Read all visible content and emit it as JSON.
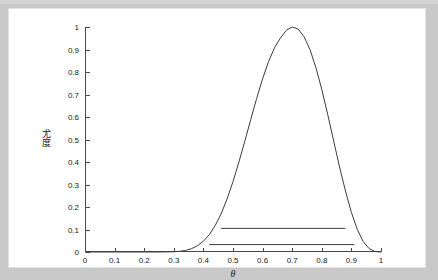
{
  "figure": {
    "background_color": "#c9c9c9",
    "card_color": "#ffffff",
    "axis_color": "#4a4a4a",
    "curve_color": "#3c3c3c"
  },
  "axis_titles": {
    "x": "θ",
    "y_char_1": "尤",
    "y_char_2": "度",
    "y_full": "尤度"
  },
  "chart_data": {
    "type": "line",
    "title": "",
    "xlabel": "θ",
    "ylabel": "尤度",
    "xlim": [
      0,
      1
    ],
    "ylim": [
      0,
      1
    ],
    "grid": false,
    "legend": "none",
    "xticks": [
      "0",
      "0.1",
      "0.2",
      "0.3",
      "0.4",
      "0.5",
      "0.6",
      "0.7",
      "0.8",
      "0.9",
      "1"
    ],
    "xtick_values": [
      0,
      0.1,
      0.2,
      0.3,
      0.4,
      0.5,
      0.6,
      0.7,
      0.8,
      0.9,
      1
    ],
    "yticks": [
      "0",
      "0.1",
      "0.2",
      "0.3",
      "0.4",
      "0.5",
      "0.6",
      "0.7",
      "0.8",
      "0.9",
      "1"
    ],
    "ytick_values": [
      0,
      0.1,
      0.2,
      0.3,
      0.4,
      0.5,
      0.6,
      0.7,
      0.8,
      0.9,
      1
    ],
    "series": [
      {
        "name": "likelihood",
        "type": "line",
        "peak_x": 0.7,
        "peak_y": 1.0,
        "x": [
          0.0,
          0.05,
          0.1,
          0.15,
          0.2,
          0.25,
          0.3,
          0.32,
          0.34,
          0.36,
          0.38,
          0.4,
          0.42,
          0.44,
          0.46,
          0.48,
          0.5,
          0.52,
          0.54,
          0.56,
          0.58,
          0.6,
          0.62,
          0.64,
          0.66,
          0.68,
          0.7,
          0.72,
          0.74,
          0.76,
          0.78,
          0.8,
          0.82,
          0.84,
          0.86,
          0.88,
          0.9,
          0.92,
          0.94,
          0.96,
          0.98,
          1.0
        ],
        "y": [
          0.0,
          0.0,
          0.0,
          0.0,
          0.0,
          0.0,
          0.001,
          0.003,
          0.007,
          0.015,
          0.028,
          0.048,
          0.077,
          0.118,
          0.17,
          0.236,
          0.313,
          0.4,
          0.493,
          0.589,
          0.683,
          0.77,
          0.846,
          0.907,
          0.951,
          0.985,
          1.0,
          0.991,
          0.957,
          0.9,
          0.82,
          0.722,
          0.611,
          0.494,
          0.378,
          0.271,
          0.176,
          0.1,
          0.046,
          0.015,
          0.002,
          0.0
        ]
      },
      {
        "name": "reference-line-upper",
        "type": "hline",
        "y": 0.105,
        "x_start": 0.46,
        "x_end": 0.88
      },
      {
        "name": "reference-line-lower",
        "type": "hline",
        "y": 0.033,
        "x_start": 0.42,
        "x_end": 0.91
      }
    ]
  }
}
